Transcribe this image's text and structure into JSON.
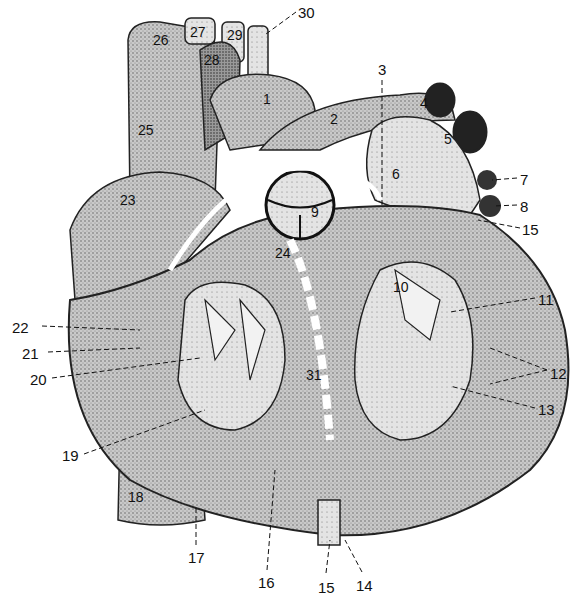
{
  "figure": {
    "style": "stipple-engraving",
    "colors": {
      "ink": "#111111",
      "paper": "#ffffff",
      "shade_dark": "#3a3a3a",
      "shade_mid": "#8c8c8c",
      "shade_light": "#cfcfcf"
    }
  },
  "labels": [
    {
      "id": "1",
      "text": "1",
      "x": 263,
      "y": 92
    },
    {
      "id": "2",
      "text": "2",
      "x": 330,
      "y": 112
    },
    {
      "id": "3",
      "text": "3",
      "x": 378,
      "y": 62
    },
    {
      "id": "4",
      "text": "4",
      "x": 420,
      "y": 96
    },
    {
      "id": "5",
      "text": "5",
      "x": 444,
      "y": 132
    },
    {
      "id": "6",
      "text": "6",
      "x": 392,
      "y": 167
    },
    {
      "id": "7",
      "text": "7",
      "x": 520,
      "y": 172
    },
    {
      "id": "8",
      "text": "8",
      "x": 520,
      "y": 199
    },
    {
      "id": "9",
      "text": "9",
      "x": 311,
      "y": 205
    },
    {
      "id": "10",
      "text": "10",
      "x": 393,
      "y": 280
    },
    {
      "id": "11",
      "text": "11",
      "x": 538,
      "y": 292
    },
    {
      "id": "12",
      "text": "12",
      "x": 550,
      "y": 366
    },
    {
      "id": "13",
      "text": "13",
      "x": 538,
      "y": 402
    },
    {
      "id": "14",
      "text": "14",
      "x": 356,
      "y": 578
    },
    {
      "id": "15b",
      "text": "15",
      "x": 318,
      "y": 580
    },
    {
      "id": "15a",
      "text": "15",
      "x": 522,
      "y": 222
    },
    {
      "id": "16",
      "text": "16",
      "x": 258,
      "y": 575
    },
    {
      "id": "17",
      "text": "17",
      "x": 188,
      "y": 550
    },
    {
      "id": "18",
      "text": "18",
      "x": 128,
      "y": 490
    },
    {
      "id": "19",
      "text": "19",
      "x": 62,
      "y": 448
    },
    {
      "id": "20",
      "text": "20",
      "x": 30,
      "y": 372
    },
    {
      "id": "21",
      "text": "21",
      "x": 22,
      "y": 346
    },
    {
      "id": "22",
      "text": "22",
      "x": 12,
      "y": 320
    },
    {
      "id": "23",
      "text": "23",
      "x": 120,
      "y": 193
    },
    {
      "id": "24",
      "text": "24",
      "x": 275,
      "y": 246
    },
    {
      "id": "25",
      "text": "25",
      "x": 138,
      "y": 123
    },
    {
      "id": "26",
      "text": "26",
      "x": 153,
      "y": 33
    },
    {
      "id": "27",
      "text": "27",
      "x": 190,
      "y": 25
    },
    {
      "id": "28",
      "text": "28",
      "x": 204,
      "y": 53
    },
    {
      "id": "29",
      "text": "29",
      "x": 227,
      "y": 28
    },
    {
      "id": "30",
      "text": "30",
      "x": 298,
      "y": 5
    },
    {
      "id": "31",
      "text": "31",
      "x": 306,
      "y": 368
    }
  ]
}
